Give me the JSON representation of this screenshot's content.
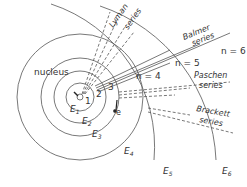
{
  "diagram": {
    "nucleus_label": "nucleus",
    "electron_label": "e",
    "orbit_numbers": [
      "1",
      "2",
      "3"
    ],
    "energy_levels": [
      "E1",
      "E2",
      "E3",
      "E4",
      "E5",
      "E6"
    ],
    "energy_level_subscripts": [
      "1",
      "2",
      "3",
      "4",
      "5",
      "6"
    ],
    "n_labels": [
      "n = 4",
      "n = 5",
      "n = 6"
    ],
    "series": [
      {
        "name": "Lyman",
        "line1": "Lyman",
        "line2": "series",
        "line_style": "dashed"
      },
      {
        "name": "Balmer",
        "line1": "Balmer",
        "line2": "series",
        "line_style": "solid"
      },
      {
        "name": "Paschen",
        "line1": "Paschen",
        "line2": "series",
        "line_style": "dashed"
      },
      {
        "name": "Brackett",
        "line1": "Brackett",
        "line2": "series",
        "line_style": "dashed"
      }
    ],
    "colors": {
      "line": "#555555",
      "text": "#333333",
      "background": "#ffffff"
    }
  }
}
